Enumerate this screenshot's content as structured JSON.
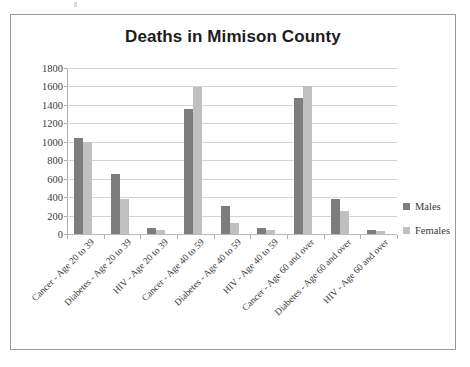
{
  "chart_data": {
    "type": "bar",
    "title": "Deaths in Mimison County",
    "xlabel": "",
    "ylabel": "",
    "ylim": [
      0,
      1800
    ],
    "ytick_step": 200,
    "yticks": [
      1800,
      1600,
      1400,
      1200,
      1000,
      800,
      600,
      400,
      200,
      0
    ],
    "grid": true,
    "legend_position": "right",
    "categories": [
      "Cancer - Age 20 to 39",
      "Diabetes - Age 20 to 39",
      "HIV - Age 20 to 39",
      "Cancer - Age 40 to 59",
      "Diabetes - Age 40 to 59",
      "HIV - Age 40 to 59",
      "Cancer - Age 60 and over",
      "Diabetes - Age 60 and over",
      "HIV - Age 60 and over"
    ],
    "series": [
      {
        "name": "Males",
        "color": "#7d7d7d",
        "values": [
          1040,
          650,
          70,
          1360,
          300,
          70,
          1480,
          380,
          40
        ]
      },
      {
        "name": "Females",
        "color": "#c0c0c0",
        "values": [
          1000,
          380,
          40,
          1590,
          120,
          40,
          1600,
          250,
          30
        ]
      }
    ]
  },
  "legend": {
    "entries": [
      {
        "label": "Males",
        "color": "#7d7d7d"
      },
      {
        "label": "Females",
        "color": "#c0c0c0"
      }
    ]
  }
}
